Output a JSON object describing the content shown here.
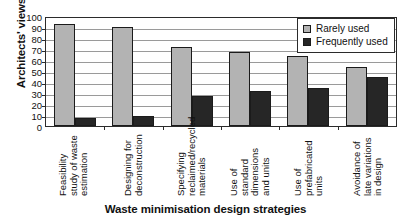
{
  "chart_data": {
    "type": "bar",
    "title": "",
    "xlabel": "Waste minimisation design strategies",
    "ylabel": "Architects' views (%)",
    "categories": [
      "Feasibility study of waste estimation",
      "Designing for deconstruction",
      "Specifying reclaimed/recycled materials",
      "Use of standard dimensions and units",
      "Use of prefabricated units",
      "Avoidance of late variations in design"
    ],
    "series": [
      {
        "name": "Rarely used",
        "color": "#b3b3b3",
        "values": [
          93,
          90,
          72,
          67,
          64,
          54
        ]
      },
      {
        "name": "Frequently used",
        "color": "#262626",
        "values": [
          7,
          9.5,
          27,
          31.5,
          35,
          44.5
        ]
      }
    ],
    "ylim": [
      0,
      100
    ],
    "ytick_labels": [
      "100",
      "90",
      "80",
      "70",
      "60",
      "50",
      "40",
      "30",
      "20",
      "10",
      "0"
    ],
    "ytick_values": [
      100,
      90,
      80,
      70,
      60,
      50,
      40,
      30,
      20,
      10,
      0
    ],
    "grid": true,
    "grid_orientation": "horizontal",
    "legend_position": "top-right",
    "legend_border": true,
    "bar_outline_color": "#1b1b1b",
    "axis_color": "#2b2b2b",
    "background": "#ffffff"
  }
}
